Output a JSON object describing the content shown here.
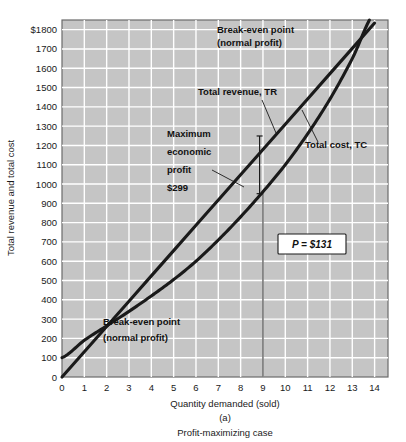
{
  "figure": {
    "panel_letter": "(a)",
    "caption": "Profit-maximizing case"
  },
  "axes": {
    "y_title": "Total revenue and total cost",
    "x_title": "Quantity demanded (sold)",
    "y_ticks": [
      "$1800",
      "1700",
      "1600",
      "1500",
      "1400",
      "1300",
      "1200",
      "1100",
      "1000",
      "900",
      "800",
      "700",
      "600",
      "500",
      "400",
      "300",
      "200",
      "100",
      "0"
    ],
    "x_ticks": [
      "0",
      "1",
      "2",
      "3",
      "4",
      "5",
      "6",
      "7",
      "8",
      "9",
      "10",
      "11",
      "12",
      "13",
      "14"
    ]
  },
  "annotations": {
    "breakeven_upper_line1": "Break-even point",
    "breakeven_upper_line2": "(normal profit)",
    "breakeven_lower_line1": "Break-even point",
    "breakeven_lower_line2": "(normal profit)",
    "tr_label": "Total revenue, TR",
    "tc_label": "Total cost, TC",
    "max_profit_line1": "Maximum",
    "max_profit_line2": "economic",
    "max_profit_line3": "profit",
    "max_profit_line4": "$299",
    "price_box": "P = $131"
  },
  "colors": {
    "plot_background": "#c5c5c5",
    "gridline": "#ffffff",
    "curve": "#1a1a1a",
    "page_background": "#ffffff",
    "axis_border": "#6b6b6b"
  },
  "chart_data": {
    "type": "line",
    "title": "Profit-maximizing case",
    "xlabel": "Quantity demanded (sold)",
    "ylabel": "Total revenue and total cost",
    "xlim": [
      0,
      14.6
    ],
    "ylim": [
      0,
      1850
    ],
    "grid": true,
    "legend": "inline-annotations",
    "x": [
      0,
      1,
      2,
      3,
      4,
      5,
      6,
      7,
      8,
      9,
      10,
      11,
      12,
      13,
      14
    ],
    "series": [
      {
        "name": "Total revenue, TR",
        "slope_per_unit": 131,
        "values": [
          0,
          131,
          262,
          393,
          524,
          655,
          786,
          917,
          1048,
          1179,
          1310,
          1441,
          1572,
          1703,
          1834
        ]
      },
      {
        "name": "Total cost, TC",
        "values": [
          100,
          190,
          265,
          340,
          420,
          505,
          600,
          710,
          830,
          960,
          1100,
          1260,
          1440,
          1650,
          1890
        ]
      }
    ],
    "markers": [
      {
        "label": "Break-even point (normal profit)",
        "x": 2.2,
        "y": 288
      },
      {
        "label": "Break-even point (normal profit)",
        "x": 13.8,
        "y": 1808
      }
    ],
    "vertical_rules": [
      {
        "x": 9,
        "from_y": 0,
        "to_y": 960,
        "note": "profit-maximizing quantity"
      }
    ],
    "profit_span": {
      "x": 8.85,
      "y_low": 950,
      "y_high": 1249,
      "amount": 299
    },
    "price": 131
  }
}
